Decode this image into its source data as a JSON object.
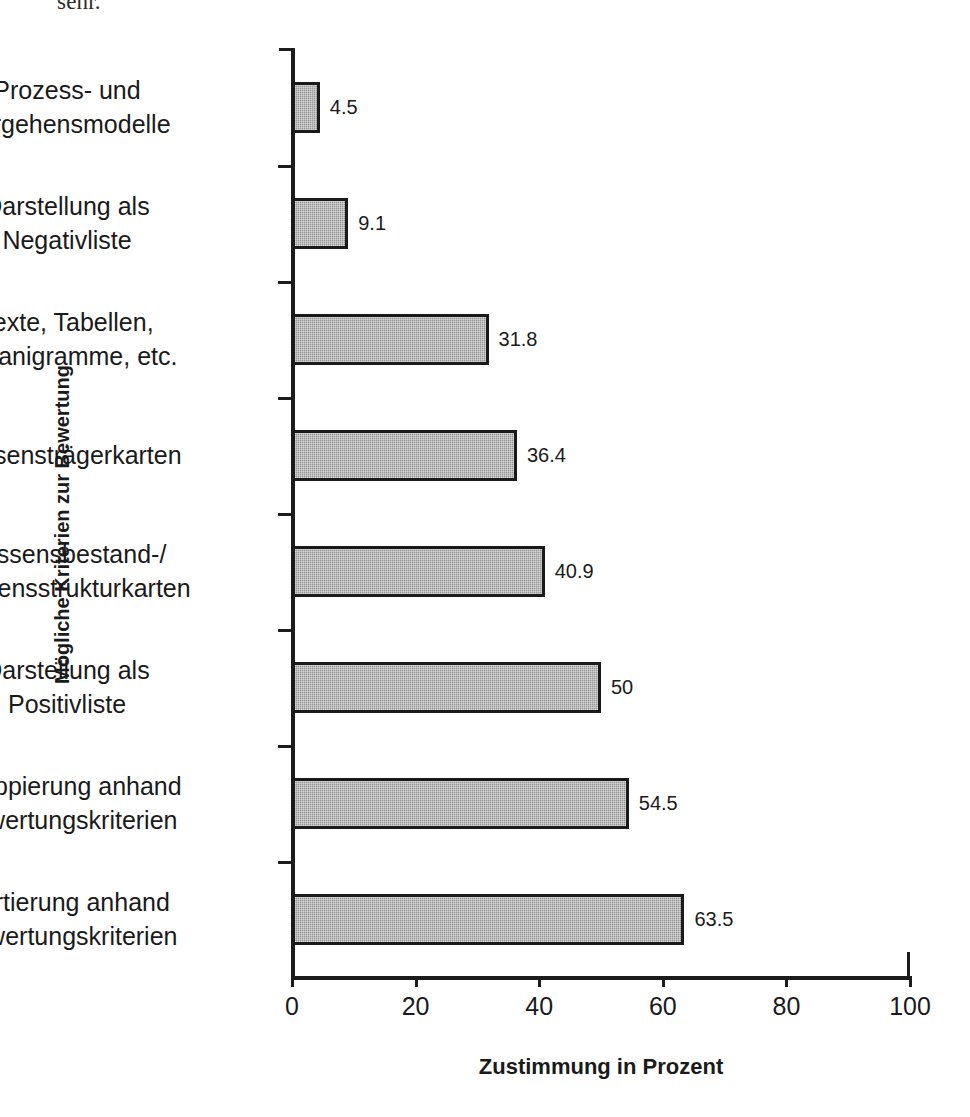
{
  "document_fragment": "sehr.",
  "chart_data": {
    "type": "bar",
    "orientation": "horizontal",
    "title": "",
    "xlabel": "Zustimmung in Prozent",
    "ylabel": "Mögliche Kriterien zur Bewertung",
    "xlim": [
      0,
      100
    ],
    "xticks": [
      "0",
      "20",
      "40",
      "60",
      "80",
      "100"
    ],
    "xtick_values": [
      0,
      20,
      40,
      60,
      80,
      100
    ],
    "grid": false,
    "legend": null,
    "bar_fill_color": "#a0a0a0",
    "bar_border_color": "#1a1a1a",
    "categories": [
      "Prozess- und Vorgehensmodelle",
      "Darstellung als Negativliste",
      "Texte, Tabellen, Organigramme, etc.",
      "Wissensträgerkarten",
      "Wissensbestand-/ Wissensstrukturkarten",
      "Darstellung als Positivliste",
      "Gruppierung anhand Bewertungskriterien",
      "Sortierung anhand Bewertungskriterien"
    ],
    "values": [
      4.5,
      9.1,
      31.8,
      36.4,
      40.9,
      50,
      54.5,
      63.5
    ],
    "value_labels": [
      "4.5",
      "9.1",
      "31.8",
      "36.4",
      "40.9",
      "50",
      "54.5",
      "63.5"
    ],
    "bars": [
      {
        "line1": "Prozess- und",
        "line2": "Vorgehensmodelle",
        "value": 4.5,
        "label": "4.5"
      },
      {
        "line1": "Darstellung als",
        "line2": "Negativliste",
        "value": 9.1,
        "label": "9.1"
      },
      {
        "line1": "Texte, Tabellen,",
        "line2": "Organigramme, etc.",
        "value": 31.8,
        "label": "31.8"
      },
      {
        "line1": "Wissensträgerkarten",
        "line2": "",
        "value": 36.4,
        "label": "36.4"
      },
      {
        "line1": "Wissensbestand-/",
        "line2": "Wissensstrukturkarten",
        "value": 40.9,
        "label": "40.9"
      },
      {
        "line1": "Darstellung als",
        "line2": "Positivliste",
        "value": 50,
        "label": "50"
      },
      {
        "line1": "Gruppierung anhand",
        "line2": "Bewertungskriterien",
        "value": 54.5,
        "label": "54.5"
      },
      {
        "line1": "Sortierung anhand",
        "line2": "Bewertungskriterien",
        "value": 63.5,
        "label": "63.5"
      }
    ]
  }
}
